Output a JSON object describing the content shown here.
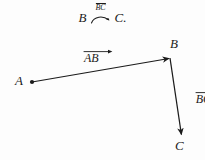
{
  "figure": {
    "background_color": "#fdfdfd",
    "stroke_color": "#1b1b1b",
    "width": 205,
    "height": 160
  },
  "caption": {
    "left_term": "B",
    "relation_label_top": "BC",
    "relation_icon": "curved-arrow-icon",
    "right_term": "C."
  },
  "labels": {
    "vector_ab": "AB",
    "vector_bc": "BC",
    "point_a": "A",
    "point_b": "B",
    "point_c": "C"
  },
  "geometry": {
    "point_a": {
      "x": 32,
      "y": 82
    },
    "point_b": {
      "x": 170,
      "y": 58
    },
    "point_c": {
      "x": 182,
      "y": 137
    },
    "segments": [
      {
        "name": "AB",
        "from": "A",
        "to": "B",
        "arrowhead": "to"
      },
      {
        "name": "BC",
        "from": "B",
        "to": "C",
        "arrowhead": "to"
      }
    ],
    "markers": [
      {
        "name": "dot-A",
        "x": 32,
        "y": 82,
        "r": 2.1
      }
    ]
  }
}
